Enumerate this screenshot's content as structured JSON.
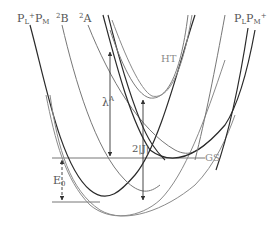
{
  "diagram": {
    "title": "",
    "curve_labels": {
      "pl_plus_pm": {
        "main": "P",
        "sub1": "L",
        "sup": "+",
        "main2": "P",
        "sub2": "M"
      },
      "state_2b": {
        "sup": "2",
        "main": "B"
      },
      "state_2a": {
        "sup": "2",
        "main": "A"
      },
      "pl_pm_plus": {
        "main": "P",
        "sub1": "L",
        "main2": "P",
        "sub2": "M",
        "sup": "+"
      },
      "ht": "HT",
      "gs": "GS"
    },
    "annotations": {
      "lambda": {
        "main": "λ",
        "sup": "A"
      },
      "coupling": "2|J|",
      "energy_gap": {
        "main": "E",
        "sub": "0"
      }
    },
    "colors": {
      "dark_curve": "#2a2a2a",
      "mid_curve": "#777777",
      "light_curve": "#9a9a9a",
      "label": "#555555"
    }
  }
}
